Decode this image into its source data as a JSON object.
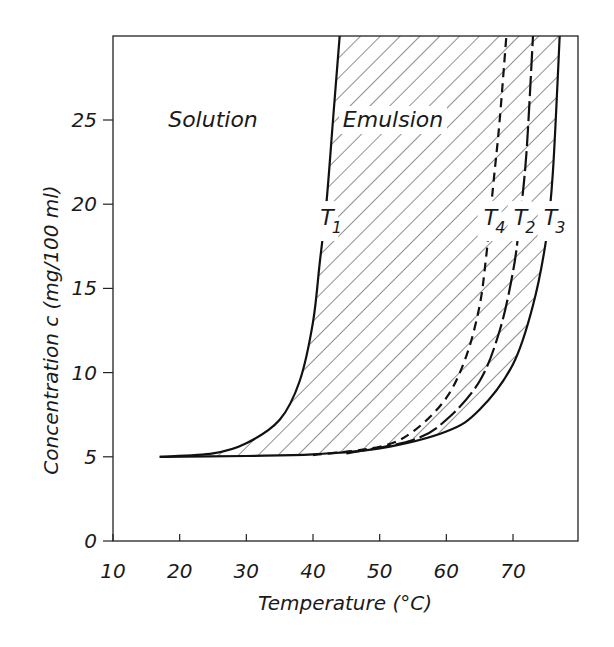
{
  "chart_data": {
    "type": "line",
    "title": "",
    "xlabel": "Temperature (°C)",
    "ylabel": "Concentration c (mg/100 ml)",
    "xlim": [
      10,
      80
    ],
    "ylim": [
      0,
      30
    ],
    "x_ticks": [
      10,
      20,
      30,
      40,
      50,
      60,
      70
    ],
    "y_ticks": [
      0,
      5,
      10,
      15,
      20,
      25
    ],
    "grid": false,
    "legend": null,
    "region_labels": [
      {
        "text": "Solution",
        "x": 25,
        "y": 25
      },
      {
        "text": "Emulsion",
        "x": 52,
        "y": 25
      }
    ],
    "hatched_region": "between T1 and T3 (Emulsion)",
    "series": [
      {
        "name": "T1",
        "style": "solid",
        "points": [
          [
            17,
            5
          ],
          [
            25,
            5.2
          ],
          [
            30,
            5.8
          ],
          [
            35,
            7.2
          ],
          [
            38,
            9.5
          ],
          [
            40,
            13
          ],
          [
            41,
            16.5
          ],
          [
            42,
            20
          ],
          [
            43,
            25
          ],
          [
            44,
            30
          ]
        ]
      },
      {
        "name": "T4",
        "style": "dashed",
        "points": [
          [
            40,
            5.1
          ],
          [
            50,
            5.6
          ],
          [
            55,
            6.5
          ],
          [
            60,
            8.5
          ],
          [
            63,
            11
          ],
          [
            65,
            14
          ],
          [
            66,
            17
          ],
          [
            67,
            21
          ],
          [
            68,
            25
          ],
          [
            69,
            30
          ]
        ]
      },
      {
        "name": "T2",
        "style": "dashed-long",
        "points": [
          [
            45,
            5.2
          ],
          [
            55,
            6
          ],
          [
            60,
            7.2
          ],
          [
            65,
            9.5
          ],
          [
            68,
            12.5
          ],
          [
            70,
            16
          ],
          [
            71,
            19
          ],
          [
            72,
            23
          ],
          [
            73,
            30
          ]
        ]
      },
      {
        "name": "T3",
        "style": "solid",
        "points": [
          [
            17,
            5
          ],
          [
            30,
            5.05
          ],
          [
            40,
            5.15
          ],
          [
            50,
            5.5
          ],
          [
            60,
            6.5
          ],
          [
            65,
            7.8
          ],
          [
            70,
            10.5
          ],
          [
            73,
            14
          ],
          [
            75,
            18
          ],
          [
            76,
            22
          ],
          [
            77,
            30
          ]
        ]
      }
    ],
    "curve_labels": [
      {
        "text": "T",
        "sub": "1",
        "series": "T1",
        "x": 42,
        "y": 19
      },
      {
        "text": "T",
        "sub": "4",
        "series": "T4",
        "x": 66.5,
        "y": 19
      },
      {
        "text": "T",
        "sub": "2",
        "series": "T2",
        "x": 71,
        "y": 19
      },
      {
        "text": "T",
        "sub": "3",
        "series": "T3",
        "x": 75.5,
        "y": 19
      }
    ]
  },
  "labels": {
    "xlabel": "Temperature (°C)",
    "ylabel": "Concentration c (mg/100 ml)",
    "solution": "Solution",
    "emulsion": "Emulsion"
  }
}
